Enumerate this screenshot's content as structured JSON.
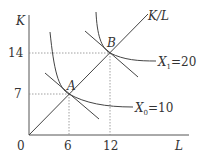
{
  "diagram": {
    "type": "isoquant-expansion-path",
    "axes": {
      "y_label": "K",
      "x_label": "L",
      "origin_label": "0",
      "y_ticks": [
        "14",
        "7"
      ],
      "x_ticks": [
        "6",
        "12"
      ]
    },
    "ray": {
      "label": "K/L"
    },
    "points": [
      {
        "name": "A",
        "L": 6,
        "K": 7
      },
      {
        "name": "B",
        "L": 12,
        "K": 14
      }
    ],
    "isoquants": [
      {
        "var": "X",
        "sub": "0",
        "eq": "=10",
        "output": 10
      },
      {
        "var": "X",
        "sub": "1",
        "eq": "=20",
        "output": 20
      }
    ],
    "colors": {
      "line": "#444444",
      "dotted": "#888888",
      "text": "#333333"
    }
  }
}
